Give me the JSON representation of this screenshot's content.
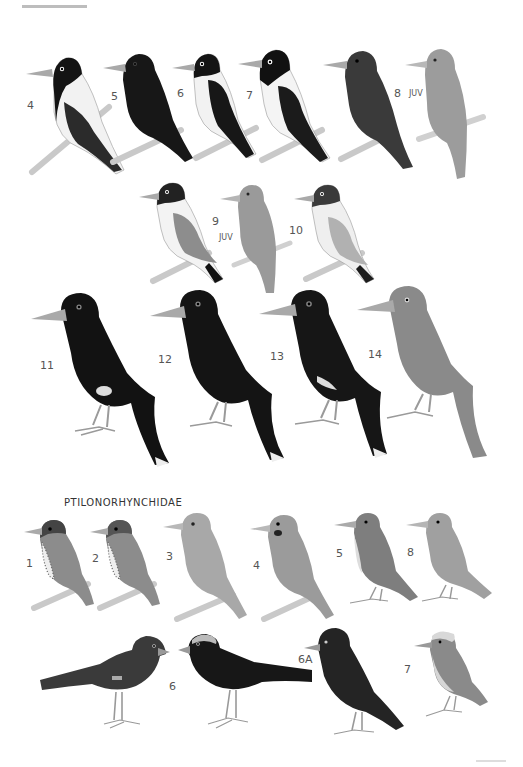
{
  "plate": {
    "family_heading": "PTILONORHYNCHIDAE",
    "colors": {
      "black": "#141414",
      "dark": "#2a2a2a",
      "grey": "#8a8a8a",
      "lightgrey": "#b3b3b3",
      "white": "#f4f4f4",
      "branch": "#c9c9c9",
      "beak": "#a9a9a9"
    }
  },
  "upper_section": {
    "row1": [
      {
        "number": "4",
        "tag": ""
      },
      {
        "number": "5",
        "tag": ""
      },
      {
        "number": "6",
        "tag": ""
      },
      {
        "number": "7",
        "tag": ""
      },
      {
        "number": "8",
        "tag": "JUV"
      }
    ],
    "row2": [
      {
        "number": "9",
        "tag": "JUV"
      },
      {
        "number": "10",
        "tag": ""
      }
    ],
    "row3": [
      {
        "number": "11",
        "tag": ""
      },
      {
        "number": "12",
        "tag": ""
      },
      {
        "number": "13",
        "tag": ""
      },
      {
        "number": "14",
        "tag": ""
      }
    ]
  },
  "lower_section": {
    "row1": [
      {
        "number": "1"
      },
      {
        "number": "2"
      },
      {
        "number": "3"
      },
      {
        "number": "4"
      },
      {
        "number": "5"
      },
      {
        "number": "8"
      }
    ],
    "row2": [
      {
        "number": "6"
      },
      {
        "number": "6A"
      },
      {
        "number": "7"
      }
    ]
  }
}
